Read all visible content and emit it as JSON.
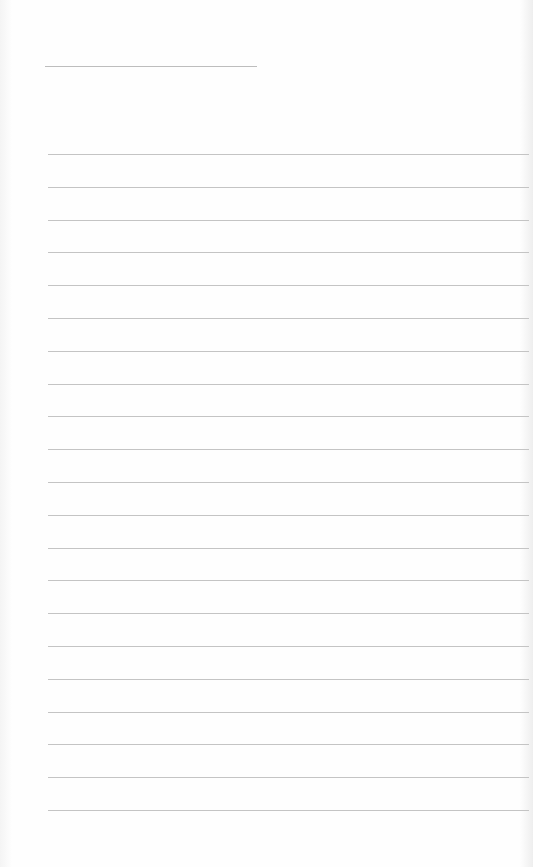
{
  "page": {
    "type": "blank-lined-paper"
  },
  "name_line": {
    "top": 66,
    "left": 45,
    "width": 212
  },
  "rules": {
    "count": 21,
    "first_top": 154,
    "spacing": 32.8,
    "color": "#c4c4c4"
  }
}
